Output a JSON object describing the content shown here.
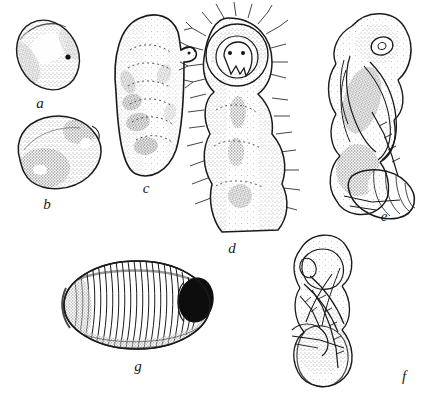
{
  "plate": {
    "kind": "scientific-illustration-plate",
    "background_color": "#ffffff",
    "ink_color": "#1a1a1a",
    "width": 432,
    "height": 396,
    "caption": "",
    "figures": [
      {
        "id": "a",
        "label": "a",
        "name": "egg-oval-stippled",
        "label_x": 40,
        "label_y": 103,
        "description": "Small oval egg with stippled shading and a dark dot"
      },
      {
        "id": "b",
        "label": "b",
        "name": "larva-first-instar-kidney",
        "label_x": 47,
        "label_y": 204,
        "description": "Kidney-shaped early instar larva, heavily stippled"
      },
      {
        "id": "c",
        "label": "c",
        "name": "larva-elongate-segmented",
        "label_x": 146,
        "label_y": 188,
        "description": "Elongate segmented larva with small head projection at upper right"
      },
      {
        "id": "d",
        "label": "d",
        "name": "larva-setose-head-capsule",
        "label_x": 232,
        "label_y": 248,
        "description": "Setose larva with head capsule, eyes and mouthparts, bristles radiating"
      },
      {
        "id": "e",
        "label": "e",
        "name": "pupa-lateral-view",
        "label_x": 384,
        "label_y": 216,
        "description": "Pupa in lateral view with wing pads, legs, antennae and eye"
      },
      {
        "id": "f",
        "label": "f",
        "name": "pupa-ventral-view",
        "label_x": 404,
        "label_y": 376,
        "description": "Pupa in ventral view showing appendages"
      },
      {
        "id": "g",
        "label": "g",
        "name": "egg-ribbed-longitudinal",
        "label_x": 138,
        "label_y": 366,
        "description": "Large ribbed egg with longitudinal striations and dark micropylar end"
      }
    ]
  }
}
